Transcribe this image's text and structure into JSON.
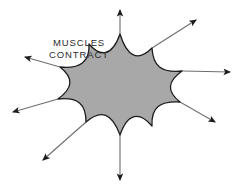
{
  "diagram": {
    "background_color": "#ffffff",
    "label": {
      "name": "muscles-contract-label",
      "line1": "MUSCLES",
      "line2": "CONTRACT",
      "color": "#2b2b2b",
      "x": 79,
      "y": 43
    },
    "shape": {
      "name": "star-burst-shape",
      "description": "eight-pointed star with concave curved edges",
      "fill_color": "#a8a8a8",
      "stroke_color": "#1c1c1c",
      "stroke_width": 1.3,
      "center": {
        "x": 120,
        "y": 96
      },
      "spike_count": 8,
      "path": "M 120 34 C 127 57, 138 62, 152 48 C 153 66, 161 73, 182 71 C 168 81, 166 91, 180 102 C 160 101, 151 107, 152 126 C 140 112, 128 112, 120 135 C 112 113, 101 109, 86 122 C 86 104, 78 97, 58 99 C 73 88, 74 78, 60 67 C 80 69, 90 62, 89 44 C 100 57, 112 57, 120 34 Z"
    },
    "arrows": [
      {
        "name": "arrow-up",
        "direction": "up",
        "x1": 120,
        "y1": 34,
        "x2": 120,
        "y2": 10,
        "color": "#1c1c1c"
      },
      {
        "name": "arrow-up-right",
        "direction": "up-right",
        "x1": 152,
        "y1": 48,
        "x2": 196,
        "y2": 20,
        "color": "#1c1c1c"
      },
      {
        "name": "arrow-right",
        "direction": "right",
        "x1": 182,
        "y1": 71,
        "x2": 230,
        "y2": 72,
        "color": "#1c1c1c"
      },
      {
        "name": "arrow-down-right",
        "direction": "down-right",
        "x1": 180,
        "y1": 102,
        "x2": 215,
        "y2": 122,
        "color": "#1c1c1c"
      },
      {
        "name": "arrow-down",
        "direction": "down",
        "x1": 120,
        "y1": 135,
        "x2": 120,
        "y2": 180,
        "color": "#1c1c1c"
      },
      {
        "name": "arrow-down-left",
        "direction": "down-left",
        "x1": 86,
        "y1": 122,
        "x2": 43,
        "y2": 160,
        "color": "#1c1c1c"
      },
      {
        "name": "arrow-left",
        "direction": "left",
        "x1": 58,
        "y1": 99,
        "x2": 13,
        "y2": 112,
        "color": "#1c1c1c"
      },
      {
        "name": "arrow-up-left",
        "direction": "up-left",
        "x1": 60,
        "y1": 67,
        "x2": 25,
        "y2": 57,
        "color": "#1c1c1c"
      }
    ]
  }
}
